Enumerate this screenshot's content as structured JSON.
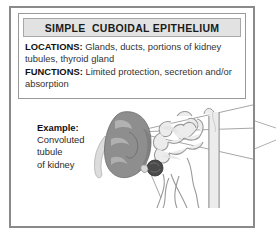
{
  "figure": {
    "title": "SIMPLE  CUBOIDAL EPITHELIUM",
    "info": {
      "locations_label": "LOCATIONS:",
      "locations_text": " Glands, ducts, portions of kidney tubules, thyroid gland",
      "functions_label": "FUNCTIONS:",
      "functions_text": " Limited protection, secretion and/or absorption"
    },
    "example": {
      "lead": "Example:",
      "line1": "Convoluted",
      "line2": "tubule",
      "line3": "of kidney"
    },
    "illustration": {
      "kidney_label": "kidney-organ",
      "nephron_label": "nephron-tubule",
      "glomerulus_label": "glomerulus",
      "ureter_label": "ureter",
      "collecting_duct_label": "collecting-duct",
      "leader_lines_label": "magnification-leader-lines"
    },
    "colors": {
      "frame": "#8a8a8a",
      "box_border": "#999999",
      "title_band": "#e2e2e2",
      "title_band_border": "#a8a8a8",
      "text": "#333333",
      "heading_text": "#111111",
      "kidney_fill": "#8e8e8e",
      "kidney_shade": "#6f6f6f",
      "kidney_light": "#b4b4b4",
      "ureter_fill": "#dcdcdc",
      "tubule_fill": "#e8e8e8",
      "tubule_stroke": "#9a9a9a",
      "glomerulus_fill": "#4a4a4a",
      "leader_line": "#8a8a8a"
    }
  }
}
